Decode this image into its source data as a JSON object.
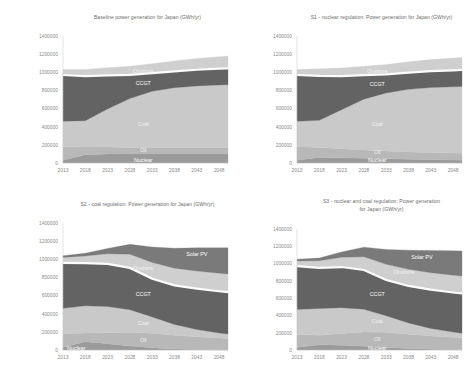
{
  "figure": {
    "background": "#ffffff",
    "panel_count": 4
  },
  "axis": {
    "ytick_labels": [
      "1400000",
      "1200000",
      "1000000",
      "800000",
      "600000",
      "400000",
      "200000",
      "0"
    ],
    "ytick_values": [
      1400000,
      1200000,
      1000000,
      800000,
      600000,
      400000,
      200000,
      0
    ],
    "xtick_labels": [
      "2013",
      "2018",
      "2023",
      "2028",
      "2033",
      "2038",
      "2043",
      "2048"
    ],
    "xtick_values": [
      2013,
      2018,
      2023,
      2028,
      2033,
      2038,
      2043,
      2048
    ],
    "ylim": [
      0,
      1400000
    ],
    "xlim": [
      2013,
      2050
    ],
    "tick_color": "#8a8a8a",
    "title_color": "#6b6b6b"
  },
  "palette": {
    "nuclear": "#9a9a9a",
    "oil": "#b8b8b8",
    "coal": "#c9c9c9",
    "ccgt": "#636363",
    "gap": "#fbfbfb",
    "onshore": "#cfcfcf",
    "solar_pv": "#7a7a7a"
  },
  "chart_data": [
    {
      "id": "baseline",
      "type": "area",
      "title": "Baseline power generation for Japan (GWh/yr)",
      "title_lines": [
        "Baseline power generation for Japan (GWh/yr)"
      ],
      "xlabel": "",
      "ylabel": "",
      "ylim": [
        0,
        1400000
      ],
      "grid": false,
      "legend": "inline-labels",
      "x": [
        2013,
        2018,
        2023,
        2028,
        2033,
        2038,
        2043,
        2048,
        2050
      ],
      "series": [
        {
          "name": "Nuclear",
          "color": "#9a9a9a",
          "label_x": 2031,
          "label_y": 35000,
          "values": [
            30000,
            92000,
            98000,
            100000,
            100000,
            100000,
            100000,
            100000,
            100000
          ]
        },
        {
          "name": "Oil",
          "color": "#b8b8b8",
          "label_x": 2031,
          "label_y": 140000,
          "values": [
            150000,
            85000,
            78000,
            72000,
            70000,
            70000,
            70000,
            70000,
            70000
          ]
        },
        {
          "name": "Coal",
          "color": "#c9c9c9",
          "label_x": 2031,
          "label_y": 430000,
          "values": [
            280000,
            290000,
            420000,
            540000,
            620000,
            660000,
            680000,
            690000,
            692000
          ]
        },
        {
          "name": "CCGT",
          "color": "#636363",
          "label_x": 2031,
          "label_y": 880000,
          "values": [
            510000,
            490000,
            370000,
            260000,
            200000,
            180000,
            178000,
            180000,
            182000
          ]
        },
        {
          "name": "Onshore",
          "color": "#cfcfcf",
          "label_x": 2031,
          "label_y": 1010000,
          "values": [
            60000,
            75000,
            85000,
            95000,
            105000,
            115000,
            125000,
            132000,
            135000
          ]
        }
      ],
      "series_order": [
        "Nuclear",
        "Oil",
        "Coal",
        "CCGT",
        "Onshore"
      ]
    },
    {
      "id": "s1_nuclear_regulation",
      "type": "area",
      "title": "S1 - nuclear regulation: Power generation for Japan (GWh/yr)",
      "title_lines": [
        "S1 - nuclear regulation: Power generation for Japan (GWh/yr)"
      ],
      "xlabel": "",
      "ylabel": "",
      "ylim": [
        0,
        1400000
      ],
      "grid": false,
      "legend": "inline-labels",
      "x": [
        2013,
        2018,
        2023,
        2028,
        2033,
        2038,
        2043,
        2048,
        2050
      ],
      "series": [
        {
          "name": "Nuclear",
          "color": "#9a9a9a",
          "label_x": 2031,
          "label_y": 28000,
          "values": [
            30000,
            60000,
            58000,
            52000,
            46000,
            40000,
            36000,
            32000,
            30000
          ]
        },
        {
          "name": "Oil",
          "color": "#b8b8b8",
          "label_x": 2031,
          "label_y": 120000,
          "values": [
            150000,
            110000,
            100000,
            92000,
            86000,
            82000,
            80000,
            78000,
            78000
          ]
        },
        {
          "name": "Coal",
          "color": "#c9c9c9",
          "label_x": 2031,
          "label_y": 430000,
          "values": [
            280000,
            300000,
            430000,
            560000,
            640000,
            690000,
            716000,
            730000,
            734000
          ]
        },
        {
          "name": "CCGT",
          "color": "#636363",
          "label_x": 2031,
          "label_y": 870000,
          "values": [
            510000,
            490000,
            370000,
            265000,
            205000,
            185000,
            180000,
            182000,
            184000
          ]
        },
        {
          "name": "Onshore",
          "color": "#cfcfcf",
          "label_x": 2031,
          "label_y": 1015000,
          "values": [
            60000,
            78000,
            88000,
            98000,
            108000,
            118000,
            128000,
            135000,
            138000
          ]
        }
      ],
      "series_order": [
        "Nuclear",
        "Oil",
        "Coal",
        "CCGT",
        "Onshore"
      ]
    },
    {
      "id": "s2_coal_regulation",
      "type": "area",
      "title": "S2 - coal regulation: Power generation for Japan (GWh/yr)",
      "title_lines": [
        "S2 - coal regulation: Power generation for Japan (GWh/yr)"
      ],
      "xlabel": "",
      "ylabel": "",
      "ylim": [
        0,
        1400000
      ],
      "grid": false,
      "legend": "inline-labels",
      "x": [
        2013,
        2018,
        2023,
        2028,
        2033,
        2038,
        2043,
        2048,
        2050
      ],
      "series": [
        {
          "name": "Nuclear",
          "color": "#9a9a9a",
          "label_x": 2016,
          "label_y": 22000,
          "values": [
            30000,
            92000,
            70000,
            45000,
            25000,
            12000,
            6000,
            3000,
            2000
          ]
        },
        {
          "name": "Oil",
          "color": "#b8b8b8",
          "label_x": 2031,
          "label_y": 110000,
          "values": [
            150000,
            95000,
            120000,
            150000,
            160000,
            150000,
            140000,
            130000,
            126000
          ]
        },
        {
          "name": "Coal",
          "color": "#c9c9c9",
          "label_x": 2031,
          "label_y": 300000,
          "values": [
            280000,
            300000,
            290000,
            250000,
            180000,
            120000,
            80000,
            55000,
            48000
          ]
        },
        {
          "name": "CCGT",
          "color": "#636363",
          "label_x": 2031,
          "label_y": 620000,
          "values": [
            500000,
            470000,
            470000,
            460000,
            420000,
            430000,
            450000,
            460000,
            462000
          ]
        },
        {
          "name": "Onshore",
          "color": "#cfcfcf",
          "label_x": 2031,
          "label_y": 900000,
          "values": [
            60000,
            80000,
            110000,
            150000,
            180000,
            190000,
            195000,
            198000,
            200000
          ]
        },
        {
          "name": "Solar PV",
          "color": "#7a7a7a",
          "label_x": 2043,
          "label_y": 1060000,
          "values": [
            20000,
            30000,
            60000,
            110000,
            170000,
            220000,
            255000,
            280000,
            288000
          ]
        }
      ],
      "series_order": [
        "Nuclear",
        "Oil",
        "Coal",
        "CCGT",
        "Onshore",
        "Solar PV"
      ]
    },
    {
      "id": "s3_nuclear_and_coal_regulation",
      "type": "area",
      "title": "S3 - nuclear and coal regulation: Power generation for Japan (GWh/yr)",
      "title_lines": [
        "S3 - nuclear and coal regulation: Power generation",
        "for Japan (GWh/yr)"
      ],
      "xlabel": "",
      "ylabel": "",
      "ylim": [
        0,
        1400000
      ],
      "grid": false,
      "legend": "inline-labels",
      "x": [
        2013,
        2018,
        2023,
        2028,
        2033,
        2038,
        2043,
        2048,
        2050
      ],
      "series": [
        {
          "name": "Nuclear",
          "color": "#9a9a9a",
          "label_x": 2031,
          "label_y": 25000,
          "values": [
            30000,
            60000,
            55000,
            44000,
            30000,
            18000,
            10000,
            5000,
            4000
          ]
        },
        {
          "name": "Oil",
          "color": "#b8b8b8",
          "label_x": 2031,
          "label_y": 130000,
          "values": [
            150000,
            110000,
            135000,
            165000,
            175000,
            165000,
            152000,
            142000,
            138000
          ]
        },
        {
          "name": "Coal",
          "color": "#c9c9c9",
          "label_x": 2031,
          "label_y": 330000,
          "values": [
            290000,
            310000,
            300000,
            262000,
            190000,
            130000,
            88000,
            60000,
            52000
          ]
        },
        {
          "name": "CCGT",
          "color": "#636363",
          "label_x": 2031,
          "label_y": 640000,
          "values": [
            500000,
            470000,
            470000,
            455000,
            415000,
            428000,
            448000,
            458000,
            460000
          ]
        },
        {
          "name": "Onshore",
          "color": "#cfcfcf",
          "label_x": 2037,
          "label_y": 900000,
          "values": [
            60000,
            82000,
            112000,
            152000,
            182000,
            192000,
            196000,
            200000,
            202000
          ]
        },
        {
          "name": "Solar PV",
          "color": "#7a7a7a",
          "label_x": 2041,
          "label_y": 1075000,
          "values": [
            20000,
            32000,
            62000,
            112000,
            172000,
            222000,
            258000,
            282000,
            290000
          ]
        }
      ],
      "series_order": [
        "Nuclear",
        "Oil",
        "Coal",
        "CCGT",
        "Onshore",
        "Solar PV"
      ]
    }
  ]
}
